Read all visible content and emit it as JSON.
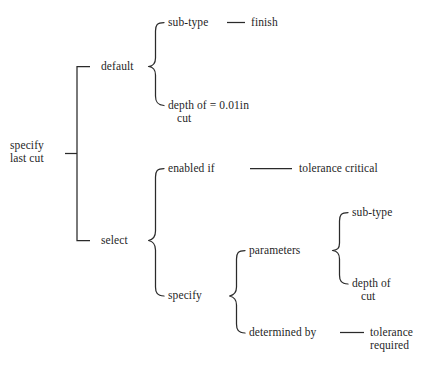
{
  "diagram": {
    "type": "brace-tree",
    "background_color": "#ffffff",
    "line_color": "#2a2a2a",
    "text_color": "#1f1f1f",
    "nodes": {
      "root": "specify\nlast cut",
      "default": "default",
      "subtype_default": "sub-type",
      "finish": "finish",
      "depth_default": "depth of = 0.01in\n   cut",
      "select": "select",
      "enabled_if": "enabled if",
      "tolerance_critical": "tolerance critical",
      "specify": "specify",
      "parameters": "parameters",
      "subtype_param": "sub-type",
      "depth_param": "depth of\n   cut",
      "determined_by": "determined by",
      "tolerance_required": "tolerance\nrequired"
    },
    "structure": [
      {
        "label": "specify last cut",
        "children": [
          {
            "label": "default",
            "children": [
              {
                "label": "sub-type",
                "value": "finish"
              },
              {
                "label": "depth of cut",
                "value": "= 0.01in"
              }
            ]
          },
          {
            "label": "select",
            "children": [
              {
                "label": "enabled if",
                "value": "tolerance critical"
              },
              {
                "label": "specify",
                "children": [
                  {
                    "label": "parameters",
                    "children": [
                      {
                        "label": "sub-type"
                      },
                      {
                        "label": "depth of cut"
                      }
                    ]
                  },
                  {
                    "label": "determined by",
                    "value": "tolerance required"
                  }
                ]
              }
            ]
          }
        ]
      }
    ]
  }
}
